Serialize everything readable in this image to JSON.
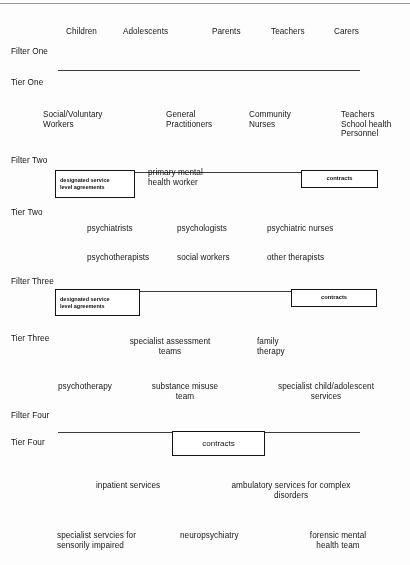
{
  "diagram": {
    "type": "tiered-framework",
    "line_color": "#3a3a3a",
    "box_border_color": "#141414",
    "text_color": "#161616"
  },
  "stage_labels": {
    "filter_one": "Filter One",
    "tier_one": "Tier One",
    "filter_two": "Filter Two",
    "tier_two": "Tier Two",
    "filter_three": "Filter Three",
    "tier_three": "Tier Three",
    "filter_four": "Filter Four",
    "tier_four": "Tier Four"
  },
  "population_row": {
    "items": [
      {
        "label": "Children"
      },
      {
        "label": "Adolescents"
      },
      {
        "label": "Parents"
      },
      {
        "label": "Teachers"
      },
      {
        "label": "Carers"
      }
    ]
  },
  "tier_one_roles": [
    {
      "label": "Social/Voluntary\nWorkers"
    },
    {
      "label": "General\nPractitioners"
    },
    {
      "label": "Community\nNurses"
    },
    {
      "label": "Teachers\nSchool health\nPersonnel"
    }
  ],
  "filter_two_band": {
    "sla_box": "designated service\nlevel agreements",
    "center_text": "primary mental\nhealth worker",
    "contracts_box": "contracts"
  },
  "tier_two_roles": [
    {
      "label": "psychiatrists"
    },
    {
      "label": "psychologists"
    },
    {
      "label": "psychiatric nurses"
    },
    {
      "label": "psychotherapists"
    },
    {
      "label": "social  workers"
    },
    {
      "label": "other therapists"
    }
  ],
  "filter_three_band": {
    "sla_box": "designated service\nlevel agreements",
    "contracts_box": "contracts"
  },
  "tier_three_services": [
    {
      "label": "specialist assessment\nteams"
    },
    {
      "label": "family\ntherapy"
    },
    {
      "label": "psychotherapy"
    },
    {
      "label": "substance misuse\nteam"
    },
    {
      "label": "specialist child/adolescent\nservices"
    }
  ],
  "filter_four_band": {
    "contracts_box": "contracts"
  },
  "tier_four_services": [
    {
      "label": "inpatient services"
    },
    {
      "label": "ambulatory services for complex\ndisorders"
    },
    {
      "label": "specialist servcies for\nsensorily impaired"
    },
    {
      "label": "neuropsychiatry"
    },
    {
      "label": "forensic mental\nhealth team"
    }
  ]
}
